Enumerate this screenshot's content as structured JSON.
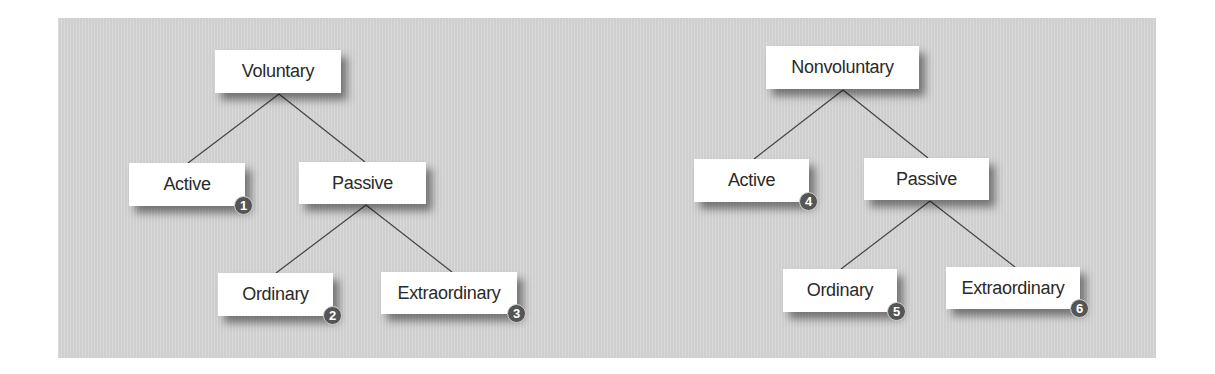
{
  "colors": {
    "panel_background": "#d6d6d6",
    "node_background": "#ffffff",
    "line": "#444444",
    "badge": "#555555",
    "badge_text": "#ffffff"
  },
  "trees": [
    {
      "root": "Voluntary",
      "children": [
        {
          "label": "Active",
          "badge": "1"
        },
        {
          "label": "Passive",
          "children": [
            {
              "label": "Ordinary",
              "badge": "2"
            },
            {
              "label": "Extraordinary",
              "badge": "3"
            }
          ]
        }
      ]
    },
    {
      "root": "Nonvoluntary",
      "children": [
        {
          "label": "Active",
          "badge": "4"
        },
        {
          "label": "Passive",
          "children": [
            {
              "label": "Ordinary",
              "badge": "5"
            },
            {
              "label": "Extraordinary",
              "badge": "6"
            }
          ]
        }
      ]
    }
  ]
}
